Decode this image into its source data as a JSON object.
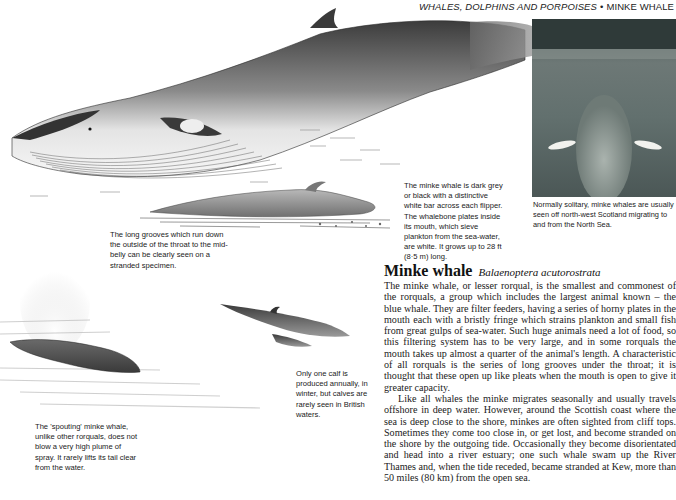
{
  "running_head": {
    "section": "WHALES, DOLPHINS AND PORPOISES",
    "separator": "•",
    "species": "MINKE WHALE"
  },
  "illustrations": {
    "main_whale": "minke-whale-breaching-illustration",
    "stranded_whale": "stranded-minke-whale-illustration",
    "spouting_whale": "spouting-minke-whale-illustration",
    "mother_and_calf": "minke-whale-mother-and-calf-illustration",
    "photo": "underwater-minke-whale-photo"
  },
  "captions": {
    "coloration": "The minke whale is dark grey or black with a distinctive white bar across each flipper. The whalebone plates inside its mouth, which sieve plankton from the sea-water, are white. It grows up to 28 ft (8·5 m) long.",
    "photo": "Normally solitary, minke whales are usually seen off north-west Scotland migrating to and from the North Sea.",
    "stranded": "The long grooves which run down the outside of the throat to the mid-belly can be clearly seen on a stranded specimen.",
    "calf": "Only one calf is produced annually, in winter, but calves are rarely seen in British waters.",
    "spouting": "The 'spouting' minke whale, unlike other rorquals, does not blow a very high plume of spray. It rarely lifts its tail clear from the water."
  },
  "article": {
    "common_name": "Minke whale",
    "latin_name": "Balaenoptera acutorostrata",
    "paragraphs": [
      "The minke whale, or lesser rorqual, is the smallest and commonest of the rorquals, a group which includes the largest animal known – the blue whale. They are filter feeders, having a series of horny plates in the mouth each with a bristly fringe which strains plankton and small fish from great gulps of sea-water. Such huge animals need a lot of food, so this filtering system has to be very large, and in some rorquals the mouth takes up almost a quarter of the animal's length. A characteristic of all rorquals is the series of long grooves under the throat; it is thought that these open up like pleats when the mouth is open to give it greater capacity.",
      "Like all whales the minke migrates seasonally and usually travels offshore in deep water. However, around the Scottish coast where the sea is deep close to the shore, minkes are often sighted from cliff tops. Sometimes they come too close in, or get lost, and become stranded on the shore by the outgoing tide. Occasionally they become disorientated and head into a river estuary; one such whale swam up the River Thames and, when the tide receded, became stranded at Kew, more than 50 miles (80 km) from the open sea."
    ]
  }
}
